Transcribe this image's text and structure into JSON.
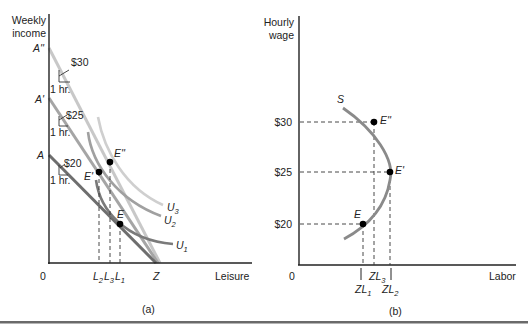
{
  "panel_a": {
    "caption": "(a)",
    "y_axis_label_line1": "Weekly",
    "y_axis_label_line2": "income",
    "x_axis_label": "Leisure",
    "origin_label": "0",
    "intercepts": {
      "a2": "A''",
      "a1": "A'",
      "a0": "A",
      "z": "Z"
    },
    "wage_annotations": [
      {
        "wage": "$30",
        "unit": "1 hr."
      },
      {
        "wage": "$25",
        "unit": "1 hr."
      },
      {
        "wage": "$20",
        "unit": "1 hr."
      }
    ],
    "points": {
      "e": "E",
      "e1": "E'",
      "e2": "E''"
    },
    "leisure_ticks": {
      "l2": "L",
      "l2_sub": "2",
      "l3": "L",
      "l3_sub": "3",
      "l1": "L",
      "l1_sub": "1"
    },
    "indifference_curves": [
      {
        "name": "U",
        "sub": "1"
      },
      {
        "name": "U",
        "sub": "2"
      },
      {
        "name": "U",
        "sub": "3"
      }
    ]
  },
  "panel_b": {
    "caption": "(b)",
    "y_axis_label_line1": "Hourly",
    "y_axis_label_line2": "wage",
    "x_axis_label": "Labor",
    "origin_label": "0",
    "curve_label": "S",
    "wage_ticks": [
      "$30",
      "$25",
      "$20"
    ],
    "points": {
      "e": "E",
      "e1": "E'",
      "e2": "E''"
    },
    "labor_ticks": {
      "zl1": "ZL",
      "zl1_sub": "1",
      "zl3": "ZL",
      "zl3_sub": "3",
      "zl2": "ZL",
      "zl2_sub": "2"
    }
  },
  "colors": {
    "axis": "#222222",
    "budget_dark": "#6e6e6e",
    "budget_mid": "#9a9a9a",
    "budget_light": "#c4c4c4",
    "curve": "#8a8a8a",
    "point": "#000000"
  }
}
